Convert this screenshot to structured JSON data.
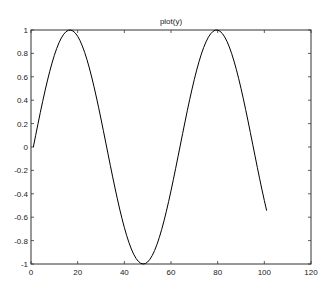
{
  "chart_data": {
    "type": "line",
    "title": "plot(y)",
    "xlabel": "",
    "ylabel": "",
    "xlim": [
      0,
      120
    ],
    "ylim": [
      -1,
      1
    ],
    "xticks": [
      0,
      20,
      40,
      60,
      80,
      100,
      120
    ],
    "yticks": [
      -1,
      -0.8,
      -0.6,
      -0.4,
      -0.2,
      0,
      0.2,
      0.4,
      0.6,
      0.8,
      1
    ],
    "xtick_labels": [
      "0",
      "20",
      "40",
      "60",
      "80",
      "100",
      "120"
    ],
    "ytick_labels": [
      "-1",
      "-0.8",
      "-0.6",
      "-0.4",
      "-0.2",
      "0",
      "0.2",
      "0.4",
      "0.6",
      "0.8",
      "1"
    ],
    "grid": false,
    "legend": null,
    "series": [
      {
        "name": "y",
        "description": "y = sin(0:0.1:10) plotted against index 1..101",
        "x_start": 1,
        "x_end": 101,
        "formula": "sin((i-1)*0.1)",
        "color": "#000000"
      }
    ]
  }
}
